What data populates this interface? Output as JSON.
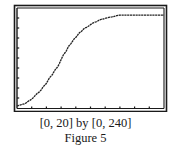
{
  "figure": {
    "window_caption": "[0, 20] by [0, 240]",
    "label": "Figure 5"
  },
  "colors": {
    "frame": "#1a1a1a",
    "curve": "#222222",
    "background": "#ffffff",
    "caption": "#1a1a1a"
  },
  "chart_data": {
    "type": "line",
    "title": "",
    "xlabel": "",
    "ylabel": "",
    "xlim": [
      0,
      20
    ],
    "ylim": [
      0,
      240
    ],
    "x_ticks_interval": 2,
    "y_ticks_interval": 24,
    "grid": false,
    "legend": null,
    "caption": "[0, 20] by [0, 240]",
    "figure_label": "Figure 5",
    "series": [
      {
        "name": "logistic curve",
        "x": [
          0,
          1,
          1.8,
          3,
          3.8,
          4.6,
          5.4,
          6.5,
          7.2,
          7.9,
          8.6,
          9.25,
          10.6,
          11.5,
          12.7,
          14,
          16,
          18,
          20
        ],
        "y": [
          5,
          10,
          19,
          38,
          55,
          76,
          96,
          132,
          152,
          168,
          182,
          192,
          206,
          213,
          218,
          223,
          223,
          223,
          223
        ]
      }
    ]
  }
}
